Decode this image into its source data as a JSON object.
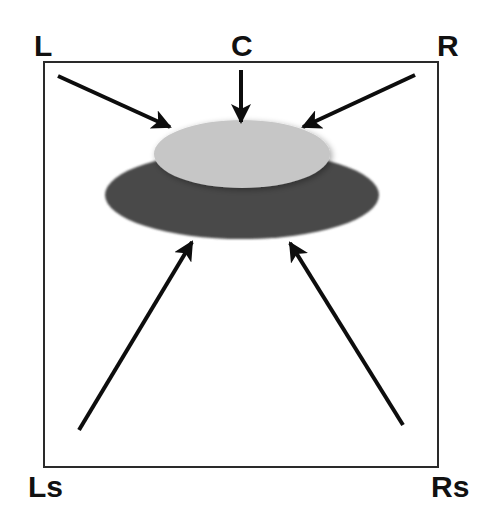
{
  "diagram": {
    "colors": {
      "frame": "#2a2a2a",
      "arrow": "#0d0d0d",
      "front_ellipse": "#c6c6c6",
      "rear_ellipse": "#4a4a4a",
      "background": "#ffffff"
    },
    "speakers": [
      {
        "id": "L",
        "label": "L"
      },
      {
        "id": "C",
        "label": "C"
      },
      {
        "id": "R",
        "label": "R"
      },
      {
        "id": "Ls",
        "label": "Ls"
      },
      {
        "id": "Rs",
        "label": "Rs"
      }
    ]
  }
}
